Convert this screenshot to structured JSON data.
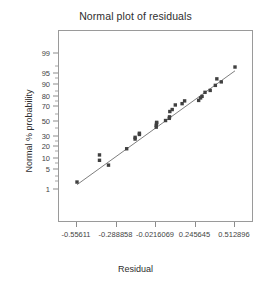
{
  "chart_data": {
    "type": "scatter",
    "title": "Normal plot of residuals",
    "xlabel": "Residual",
    "ylabel": "Normal % probability",
    "grid": false,
    "legend": null,
    "xlim": [
      -0.55611,
      0.512896
    ],
    "xticklabels": [
      "-0.55611",
      "-0.288858",
      "-0.0216069",
      "0.245645",
      "0.512896"
    ],
    "xtickvalues": [
      -0.55611,
      -0.288858,
      -0.0216069,
      0.245645,
      0.512896
    ],
    "yscale": "normal-probability",
    "ylim": [
      1,
      99
    ],
    "yticklabels": [
      "1",
      "5",
      "10",
      "20",
      "30",
      "50",
      "70",
      "80",
      "90",
      "95",
      "99"
    ],
    "ytickvalues": [
      1,
      5,
      10,
      20,
      30,
      50,
      70,
      80,
      90,
      95,
      99
    ],
    "series": [
      {
        "name": "residuals",
        "marker": "square",
        "color": "#404040",
        "x": [
          -0.5561,
          -0.404,
          -0.404,
          -0.343,
          -0.22,
          -0.163,
          -0.163,
          -0.134,
          -0.134,
          -0.02,
          -0.02,
          -0.018,
          -0.017,
          0.043,
          0.068,
          0.07,
          0.072,
          0.088,
          0.109,
          0.155,
          0.172,
          0.267,
          0.28,
          0.29,
          0.31,
          0.345,
          0.38,
          0.39,
          0.42,
          0.5129
        ],
        "y": [
          2.0,
          13.0,
          9.5,
          7.0,
          18.0,
          28.0,
          30.0,
          33.5,
          35.0,
          45.5,
          43.0,
          48.5,
          49.5,
          52.0,
          55.0,
          57.0,
          64.0,
          66.5,
          72.0,
          73.5,
          76.5,
          77.0,
          79.5,
          81.0,
          84.5,
          86.0,
          89.5,
          93.0,
          91.5,
          97.0
        ]
      }
    ],
    "reference_line": {
      "name": "normal-reference-line",
      "color": "#6f6f6f",
      "x": [
        -0.5561,
        0.512896
      ],
      "y": [
        1.6,
        96.0
      ]
    }
  },
  "axes": {
    "y_ticks_major": [
      {
        "label": "99",
        "value": 99
      },
      {
        "label": "95",
        "value": 95
      },
      {
        "label": "90",
        "value": 90
      },
      {
        "label": "80",
        "value": 80
      },
      {
        "label": "70",
        "value": 70
      },
      {
        "label": "50",
        "value": 50
      },
      {
        "label": "30",
        "value": 30
      },
      {
        "label": "20",
        "value": 20
      },
      {
        "label": "10",
        "value": 10
      },
      {
        "label": "5",
        "value": 5
      },
      {
        "label": "1",
        "value": 1
      }
    ],
    "y_ticks_minor": [
      97,
      93,
      85,
      75,
      60,
      40,
      25,
      15,
      7.5,
      3,
      2
    ]
  }
}
